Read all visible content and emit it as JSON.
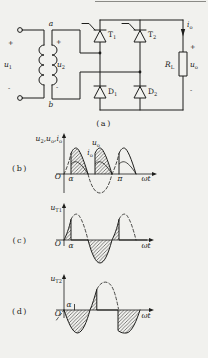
{
  "page": {
    "bg": "#f1f1ee",
    "ink": "#1d1d1b"
  },
  "circuit": {
    "panel_label": "(a)",
    "input": {
      "plus": "+",
      "minus": "-",
      "u1": {
        "base": "u",
        "sub": "1"
      }
    },
    "transformer": {
      "a": "a",
      "b": "b",
      "plus": "+",
      "minus": "-",
      "u2": {
        "base": "u",
        "sub": "2"
      }
    },
    "thyristor1": {
      "base": "T",
      "sub": "1"
    },
    "thyristor2": {
      "base": "T",
      "sub": "2"
    },
    "diode1": {
      "base": "D",
      "sub": "1"
    },
    "diode2": {
      "base": "D",
      "sub": "2"
    },
    "load": {
      "io": {
        "base": "i",
        "sub": "o"
      },
      "rl": {
        "base": "R",
        "sub": "L"
      },
      "uo": {
        "base": "u",
        "sub": "o"
      },
      "plus": "+",
      "minus": "-"
    }
  },
  "waveform_b": {
    "panel_label": "(b)",
    "ylabel": [
      {
        "base": "u",
        "sub": "2"
      },
      {
        "base": "u",
        "sub": "o"
      },
      {
        "base": "i",
        "sub": "o"
      }
    ],
    "ylabel_sep": ",",
    "origin": "O",
    "alpha": "α",
    "pi": "π",
    "xlabel": "ωt",
    "uo_label": {
      "base": "u",
      "sub": "o"
    },
    "io_label": {
      "base": "i",
      "sub": "o"
    }
  },
  "waveform_c": {
    "panel_label": "(c)",
    "ylabel": {
      "base": "u",
      "sub": "T1"
    },
    "origin": "O",
    "alpha": "α",
    "xlabel": "ωt"
  },
  "waveform_d": {
    "panel_label": "(d)",
    "ylabel": {
      "base": "u",
      "sub": "T2"
    },
    "origin": "O",
    "alpha": "α",
    "xlabel": "ωt"
  }
}
